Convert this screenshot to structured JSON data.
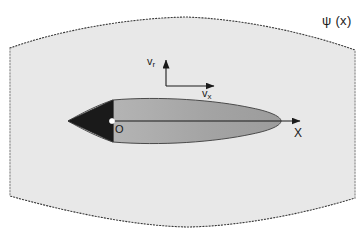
{
  "figure": {
    "kind": "fluid-flow-schematic",
    "background_color": "#ffffff",
    "stream_region": {
      "name": "stream-tube-region",
      "fill_color": "#e8e8e8",
      "border_color": "#3a3a3a",
      "border_style": "dotted",
      "label": "ψ (x)",
      "label_symbol_greek": "psi",
      "label_position": {
        "x": 325,
        "y": 16
      }
    },
    "body": {
      "name": "axisymmetric-body",
      "nose_cone": {
        "label": "nose-cone",
        "fill_color": "#1a1a1a",
        "tip_x": 68,
        "base_x": 113
      },
      "afterbody": {
        "label": "ogive-afterbody",
        "fill_color": "#a8a8a8",
        "outline_color": "#4a4a4a",
        "start_x": 113,
        "end_x": 281
      }
    },
    "origin": {
      "name": "origin-point",
      "label": "O",
      "marker_color": "#ffffff",
      "x": 112,
      "y": 121
    },
    "axes": {
      "x_axis": {
        "label": "X",
        "from_x": 112,
        "to_x": 302,
        "y": 121,
        "color": "#1a1a1a"
      },
      "velocity_frame": {
        "corner_x": 166,
        "corner_y": 86,
        "vertical": {
          "label": "v",
          "subscript": "r",
          "length": 28,
          "direction": "up"
        },
        "horizontal": {
          "label": "v",
          "subscript": "x",
          "length": 50,
          "direction": "right"
        },
        "color": "#1a1a1a"
      }
    }
  }
}
